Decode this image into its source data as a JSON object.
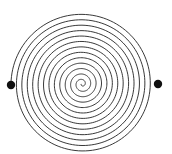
{
  "diagram": {
    "type": "archimedean-spiral",
    "center": [
      82,
      84
    ],
    "outer_radius": 71,
    "inner_radius": 0.5,
    "turns": 13,
    "start_angle_deg": 180,
    "direction": "clockwise-inward",
    "stroke_color": "#222222",
    "stroke_width": 0.9,
    "endpoints": [
      {
        "name": "left-dot",
        "cx": 11,
        "cy": 85,
        "r": 4.2,
        "color": "#111111"
      },
      {
        "name": "right-dot",
        "cx": 158,
        "cy": 84,
        "r": 4.2,
        "color": "#111111"
      }
    ],
    "start_tail": {
      "from": [
        11,
        85
      ],
      "to": [
        11,
        84
      ]
    }
  }
}
